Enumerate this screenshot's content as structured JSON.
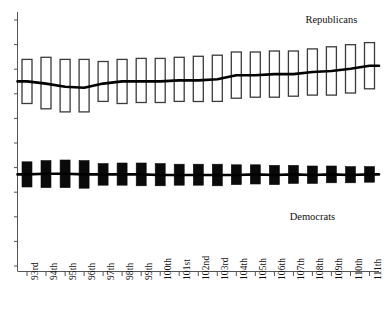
{
  "chart_data": {
    "type": "bar",
    "title": "",
    "subtitle": "",
    "xlabel": "",
    "ylabel": "",
    "grid": false,
    "legend_position": "inline-annotations",
    "categories": [
      "93rd",
      "94th",
      "95th",
      "96th",
      "97th",
      "98th",
      "99th",
      "100th",
      "101st",
      "102nd",
      "103rd",
      "104th",
      "105th",
      "106th",
      "107th",
      "108th",
      "109th",
      "110th",
      "111th"
    ],
    "axis": {
      "x_range": [
        0,
        19
      ],
      "y_range": [
        0,
        100
      ],
      "y_ticks_visible": true,
      "y_tick_labels_shown": false,
      "y_tick_count": 11
    },
    "series": [
      {
        "name": "Republicans",
        "style": "hollow-bar-with-trendline",
        "fill": "#ffffff",
        "stroke": "#3b3b3b",
        "bar_low": [
          30,
          25,
          22,
          22,
          32,
          30,
          31,
          31,
          32,
          32,
          32,
          35,
          36,
          36,
          37,
          38,
          38,
          40,
          44
        ],
        "bar_high": [
          72,
          74,
          72,
          72,
          70,
          72,
          73,
          73,
          74,
          75,
          76,
          79,
          79,
          80,
          80,
          82,
          84,
          86,
          88
        ],
        "trend": [
          51,
          49,
          46,
          45,
          49,
          51,
          51,
          51,
          52,
          52,
          53,
          57,
          57,
          58,
          58,
          60,
          61,
          63,
          66
        ]
      },
      {
        "name": "Democrats",
        "style": "solid-bar-with-trendline",
        "fill": "#0a0a0a",
        "stroke": "#0a0a0a",
        "bar_low": [
          -20,
          -21,
          -21,
          -22,
          -17,
          -17,
          -18,
          -18,
          -17,
          -17,
          -18,
          -16,
          -15,
          -16,
          -14,
          -14,
          -13,
          -13,
          -12
        ],
        "bar_high": [
          22,
          24,
          25,
          24,
          19,
          20,
          20,
          19,
          18,
          18,
          18,
          17,
          17,
          16,
          16,
          15,
          15,
          14,
          14
        ],
        "trend": [
          1,
          2,
          2,
          1,
          1,
          1,
          1,
          0,
          0,
          0,
          0,
          0,
          1,
          0,
          1,
          0,
          1,
          0,
          1
        ]
      }
    ],
    "annotations": [
      {
        "name": "republicans-label",
        "text": "Republicans",
        "x_category": "109th",
        "position": "above-bars"
      },
      {
        "name": "democrats-label",
        "text": "Democrats",
        "x_category": "108th",
        "position": "below-bars"
      }
    ]
  },
  "labels": {
    "republicans": "Republicans",
    "democrats": "Democrats"
  },
  "colors": {
    "republican_fill": "#ffffff",
    "republican_stroke": "#3b3b3b",
    "democrat_fill": "#0a0a0a",
    "axis": "#555555",
    "trendline": "#000000",
    "background": "#ffffff"
  }
}
